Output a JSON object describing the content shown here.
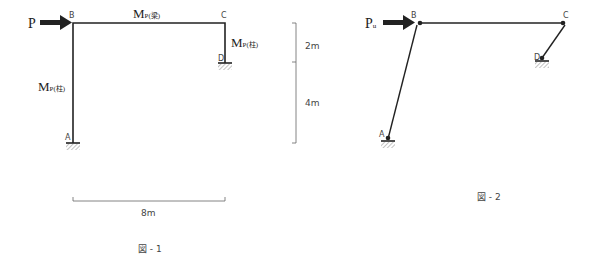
{
  "figure1": {
    "caption": "図 - 1",
    "load_label": "P",
    "nodes": {
      "A": "A",
      "B": "B",
      "C": "C",
      "D": "D"
    },
    "moment_beam": {
      "main": "M",
      "sub": "P(梁)"
    },
    "moment_col_left": {
      "main": "M",
      "sub": "P(柱)"
    },
    "moment_col_right": {
      "main": "M",
      "sub": "P(柱)"
    },
    "dim_width": "8m",
    "dim_upper": "2m",
    "dim_lower": "4m"
  },
  "figure2": {
    "caption": "図 - 2",
    "load_label": {
      "main": "P",
      "sub": "u"
    },
    "nodes": {
      "A": "A",
      "B": "B",
      "C": "C",
      "D": "D"
    }
  },
  "colors": {
    "line": "#222222",
    "dim": "#555555",
    "hatch": "#888888"
  }
}
